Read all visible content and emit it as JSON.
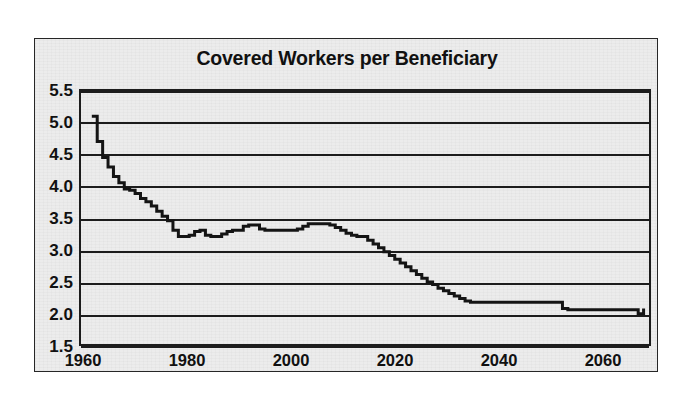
{
  "figure": {
    "title": "Covered Workers per Beneficiary",
    "background_color": "#ececec",
    "frame_color": "#262626",
    "line_color": "#141414"
  },
  "chart_data": {
    "type": "line",
    "title": "Covered Workers per Beneficiary",
    "xlabel": "",
    "ylabel": "",
    "xlim": [
      1958,
      2063
    ],
    "ylim": [
      1.5,
      5.5
    ],
    "grid": true,
    "legend": "none",
    "xticks": [
      1960,
      1980,
      2000,
      2020,
      2040,
      2060
    ],
    "yticks": [
      1.5,
      2.0,
      2.5,
      3.0,
      3.5,
      4.0,
      4.5,
      5.0,
      5.5
    ],
    "ytick_labels": [
      "1.5",
      "2.0",
      "2.5",
      "3.0",
      "3.5",
      "4.0",
      "4.5",
      "5.0",
      "5.5"
    ],
    "xtick_labels": [
      "1960",
      "1980",
      "2000",
      "2020",
      "2040",
      "2060"
    ],
    "series": [
      {
        "name": "Covered workers per beneficiary",
        "x": [
          1960,
          1961,
          1962,
          1963,
          1964,
          1965,
          1966,
          1967,
          1968,
          1969,
          1970,
          1971,
          1972,
          1973,
          1974,
          1975,
          1976,
          1977,
          1978,
          1979,
          1980,
          1981,
          1982,
          1983,
          1984,
          1985,
          1986,
          1987,
          1988,
          1989,
          1990,
          1991,
          1992,
          1993,
          1994,
          1995,
          1996,
          1997,
          1998,
          1999,
          2000,
          2001,
          2002,
          2003,
          2004,
          2005,
          2006,
          2007,
          2008,
          2009,
          2010,
          2011,
          2012,
          2013,
          2014,
          2015,
          2016,
          2017,
          2018,
          2019,
          2020,
          2021,
          2022,
          2023,
          2024,
          2025,
          2026,
          2027,
          2028,
          2029,
          2030,
          2031,
          2032,
          2033,
          2034,
          2035,
          2036,
          2037,
          2038,
          2039,
          2040,
          2041,
          2042,
          2043,
          2044,
          2045,
          2046,
          2047,
          2048,
          2049,
          2050,
          2051,
          2052,
          2053,
          2054,
          2055,
          2056,
          2057,
          2058,
          2059,
          2060,
          2061,
          2062
        ],
        "y": [
          5.1,
          4.7,
          4.45,
          4.3,
          4.15,
          4.05,
          3.95,
          3.93,
          3.88,
          3.8,
          3.75,
          3.68,
          3.6,
          3.52,
          3.45,
          3.3,
          3.2,
          3.2,
          3.22,
          3.28,
          3.3,
          3.22,
          3.2,
          3.2,
          3.24,
          3.28,
          3.3,
          3.3,
          3.36,
          3.38,
          3.38,
          3.32,
          3.3,
          3.3,
          3.3,
          3.3,
          3.3,
          3.3,
          3.32,
          3.36,
          3.4,
          3.4,
          3.4,
          3.4,
          3.38,
          3.34,
          3.3,
          3.25,
          3.22,
          3.2,
          3.2,
          3.14,
          3.08,
          3.02,
          2.96,
          2.9,
          2.84,
          2.78,
          2.72,
          2.66,
          2.6,
          2.54,
          2.48,
          2.44,
          2.38,
          2.34,
          2.3,
          2.26,
          2.22,
          2.18,
          2.16,
          2.16,
          2.16,
          2.16,
          2.16,
          2.16,
          2.16,
          2.16,
          2.16,
          2.16,
          2.16,
          2.16,
          2.16,
          2.16,
          2.16,
          2.16,
          2.16,
          2.06,
          2.04,
          2.04,
          2.04,
          2.04,
          2.04,
          2.04,
          2.04,
          2.04,
          2.04,
          2.04,
          2.04,
          2.04,
          2.04,
          1.98,
          2.06
        ],
        "color": "#141414",
        "style": "step-like solid line",
        "width": 3
      }
    ],
    "annotations": [
      {
        "text": "Starts near 5.1 in 1960, falls steeply through the 1960s"
      },
      {
        "text": "Plateau near 3.2-3.4 from mid-1970s to late 2000s"
      },
      {
        "text": "Staircase decline from about 3.2 in 2010 to about 2.16 by 2030"
      },
      {
        "text": "Flat near 2.16 to mid-2040s, then about 2.04 to 2060"
      }
    ]
  }
}
